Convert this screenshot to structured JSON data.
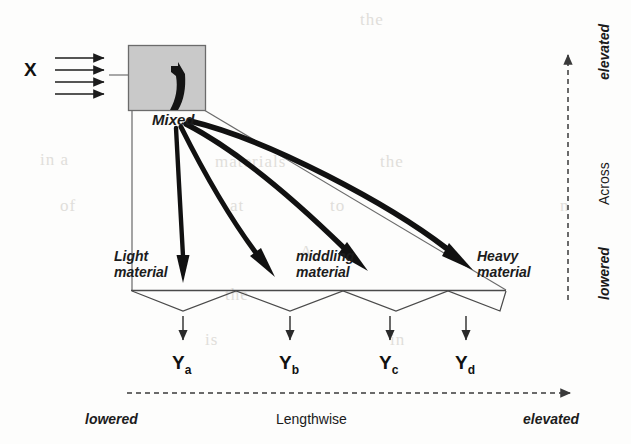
{
  "diagram": {
    "feed": {
      "label": "X",
      "stream_count": 4
    },
    "deck": {
      "box_label": "Mixed",
      "box_fill": "#c9c9c9",
      "box_stroke": "#6b6b6b"
    },
    "zones": [
      {
        "id": "light",
        "label": "Light\nmaterial",
        "line1": "Light",
        "line2": "material"
      },
      {
        "id": "middling",
        "label": "middling\nmaterial",
        "line1": "middling",
        "line2": "material"
      },
      {
        "id": "heavy",
        "label": "Heavy\nmaterial",
        "line1": "Heavy",
        "line2": "material"
      }
    ],
    "outputs": [
      {
        "id": "ya",
        "base": "Y",
        "sub": "a"
      },
      {
        "id": "yb",
        "base": "Y",
        "sub": "b"
      },
      {
        "id": "yc",
        "base": "Y",
        "sub": "c"
      },
      {
        "id": "yd",
        "base": "Y",
        "sub": "d"
      }
    ],
    "axes": {
      "horizontal": {
        "name": "Lengthwise",
        "low_label": "lowered",
        "high_label": "elevated",
        "direction": "left-to-right"
      },
      "vertical": {
        "name": "Across",
        "low_label": "lowered",
        "high_label": "elevated",
        "direction": "bottom-to-top"
      }
    },
    "colors": {
      "ink": "#1c1c1c",
      "thin_line": "#555555",
      "box_fill": "#c9c9c9",
      "paper": "#fdfdfc"
    },
    "flow_arrow_count": 4,
    "hopper_count": 4
  },
  "ghost_text": [
    {
      "t": "the",
      "x": 360,
      "y": 10
    },
    {
      "t": "in a",
      "x": 40,
      "y": 150
    },
    {
      "t": "of",
      "x": 60,
      "y": 196
    },
    {
      "t": "materials",
      "x": 215,
      "y": 152
    },
    {
      "t": "the",
      "x": 380,
      "y": 152
    },
    {
      "t": "at",
      "x": 230,
      "y": 196
    },
    {
      "t": "to",
      "x": 330,
      "y": 196
    },
    {
      "t": "A",
      "x": 300,
      "y": 242
    },
    {
      "t": "the",
      "x": 225,
      "y": 285
    },
    {
      "t": "is",
      "x": 205,
      "y": 330
    },
    {
      "t": "in",
      "x": 390,
      "y": 330
    },
    {
      "t": "n",
      "x": 560,
      "y": 196
    }
  ]
}
